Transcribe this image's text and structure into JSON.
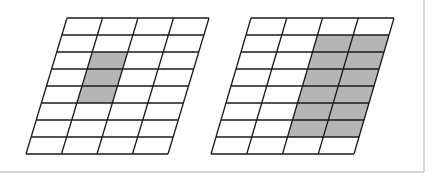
{
  "figure": {
    "colors": {
      "background": "#ffffff",
      "grid_line": "#1a1a1a",
      "shade": "#b5b5b5",
      "frame": "#c8c8c8"
    },
    "frame": {
      "right_x": 424,
      "bottom_y": 172
    },
    "grids": [
      {
        "name": "left-grid",
        "cols": 4,
        "rows": 8,
        "top_left": [
          67,
          18
        ],
        "top_right": [
          209,
          18
        ],
        "bottom_left": [
          26,
          154
        ],
        "shaded_cells": [
          [
            2,
            1
          ],
          [
            3,
            1
          ],
          [
            4,
            1
          ]
        ]
      },
      {
        "name": "right-grid",
        "cols": 4,
        "rows": 8,
        "top_left": [
          251,
          18
        ],
        "top_right": [
          394,
          18
        ],
        "bottom_left": [
          211,
          154
        ],
        "shaded_cells": [
          [
            1,
            2
          ],
          [
            1,
            3
          ],
          [
            2,
            2
          ],
          [
            2,
            3
          ],
          [
            3,
            2
          ],
          [
            3,
            3
          ],
          [
            4,
            2
          ],
          [
            4,
            3
          ],
          [
            5,
            2
          ],
          [
            5,
            3
          ],
          [
            6,
            2
          ],
          [
            6,
            3
          ]
        ]
      }
    ]
  }
}
